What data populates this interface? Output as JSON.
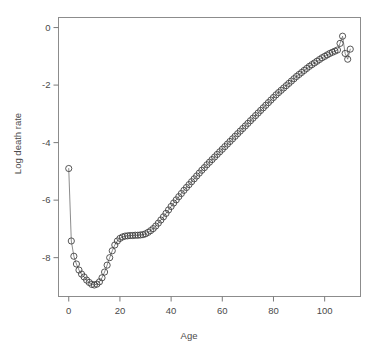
{
  "figure": {
    "top_partial_text": "",
    "background_color": "#ffffff",
    "width": 378,
    "height": 352
  },
  "axes": {
    "x_title": "Age",
    "y_title": "Log death rate",
    "x_ticks": [
      "0",
      "20",
      "40",
      "60",
      "80",
      "100"
    ],
    "y_ticks": [
      "0",
      "-2",
      "-4",
      "-6",
      "-8"
    ],
    "frame_color": "#8c8c8c",
    "tick_color": "#7a7a7a",
    "label_color": "#4a4a4a"
  },
  "chart_data": {
    "type": "line",
    "title": "",
    "subtitle": "",
    "xlabel": "Age",
    "ylabel": "Log death rate",
    "xlim": [
      -4,
      114
    ],
    "ylim": [
      -9.35,
      0.35
    ],
    "xticks": [
      0,
      20,
      40,
      60,
      80,
      100
    ],
    "yticks": [
      0,
      -2,
      -4,
      -6,
      -8
    ],
    "grid": false,
    "legend": null,
    "marker": "open-circle",
    "marker_size": 3.1,
    "marker_color": "#3a3a3a",
    "line_color": "#6e6e6e",
    "line_width": 0.8,
    "series": [
      {
        "name": "Log death rate",
        "x": [
          0,
          1,
          2,
          3,
          4,
          5,
          6,
          7,
          8,
          9,
          10,
          11,
          12,
          13,
          14,
          15,
          16,
          17,
          18,
          19,
          20,
          21,
          22,
          23,
          24,
          25,
          26,
          27,
          28,
          29,
          30,
          31,
          32,
          33,
          34,
          35,
          36,
          37,
          38,
          39,
          40,
          41,
          42,
          43,
          44,
          45,
          46,
          47,
          48,
          49,
          50,
          51,
          52,
          53,
          54,
          55,
          56,
          57,
          58,
          59,
          60,
          61,
          62,
          63,
          64,
          65,
          66,
          67,
          68,
          69,
          70,
          71,
          72,
          73,
          74,
          75,
          76,
          77,
          78,
          79,
          80,
          81,
          82,
          83,
          84,
          85,
          86,
          87,
          88,
          89,
          90,
          91,
          92,
          93,
          94,
          95,
          96,
          97,
          98,
          99,
          100,
          101,
          102,
          103,
          104,
          105,
          106,
          107,
          108,
          109,
          110
        ],
        "y": [
          -4.9,
          -7.42,
          -7.95,
          -8.22,
          -8.43,
          -8.57,
          -8.67,
          -8.78,
          -8.86,
          -8.93,
          -8.95,
          -8.92,
          -8.84,
          -8.7,
          -8.5,
          -8.26,
          -8.0,
          -7.76,
          -7.56,
          -7.42,
          -7.33,
          -7.28,
          -7.25,
          -7.24,
          -7.23,
          -7.23,
          -7.22,
          -7.22,
          -7.21,
          -7.2,
          -7.17,
          -7.12,
          -7.06,
          -6.99,
          -6.9,
          -6.8,
          -6.69,
          -6.58,
          -6.46,
          -6.34,
          -6.22,
          -6.1,
          -5.99,
          -5.88,
          -5.77,
          -5.66,
          -5.56,
          -5.46,
          -5.36,
          -5.26,
          -5.16,
          -5.06,
          -4.96,
          -4.87,
          -4.77,
          -4.68,
          -4.59,
          -4.5,
          -4.41,
          -4.32,
          -4.23,
          -4.14,
          -4.05,
          -3.96,
          -3.87,
          -3.78,
          -3.69,
          -3.6,
          -3.51,
          -3.42,
          -3.33,
          -3.24,
          -3.15,
          -3.06,
          -2.97,
          -2.88,
          -2.79,
          -2.7,
          -2.61,
          -2.52,
          -2.43,
          -2.34,
          -2.26,
          -2.18,
          -2.1,
          -2.02,
          -1.94,
          -1.86,
          -1.78,
          -1.7,
          -1.63,
          -1.56,
          -1.49,
          -1.42,
          -1.35,
          -1.29,
          -1.23,
          -1.17,
          -1.11,
          -1.05,
          -1.0,
          -0.95,
          -0.9,
          -0.86,
          -0.82,
          -0.78,
          -0.55,
          -0.3,
          -0.9,
          -1.1,
          -0.75
        ]
      }
    ],
    "annotations": [
      {
        "name": "infant-mortality-spike",
        "x": 0,
        "y": -4.9
      },
      {
        "name": "minimum",
        "x": 10,
        "y": -8.95
      },
      {
        "name": "accident-hump",
        "x": 24,
        "y": -7.23
      },
      {
        "name": "old-age-scatter-start",
        "x": 105,
        "y": -0.55
      }
    ]
  }
}
